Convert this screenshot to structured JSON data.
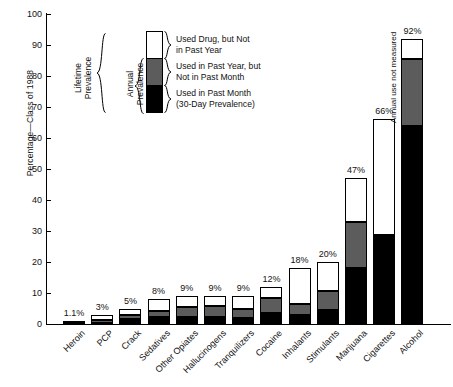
{
  "chart_data": {
    "type": "bar",
    "title": "",
    "subtitle": "",
    "xlabel": "",
    "ylabel": "Percentage—Class of 1988",
    "ylim": [
      0,
      100
    ],
    "ytick_values": [
      0,
      10,
      20,
      30,
      40,
      50,
      60,
      70,
      80,
      90,
      100
    ],
    "ytick_labels": [
      "0",
      "10",
      "20",
      "30",
      "40",
      "50",
      "60",
      "70",
      "80",
      "90",
      "100"
    ],
    "grid": false,
    "legend_position": "inside-upper-left",
    "stacked": true,
    "categories": [
      "Heroin",
      "PCP",
      "Crack",
      "Sedatives",
      "Other Opiates",
      "Hallucinogens",
      "Tranquilizers",
      "Cocaine",
      "Inhalants",
      "Stimulants",
      "Marijuana",
      "Cigarettes",
      "Alcohol"
    ],
    "series": [
      {
        "name": "Used in Past Month (30-Day Prevalence)",
        "color": "#000000",
        "values": [
          0.2,
          0.3,
          1.6,
          2.3,
          2.4,
          2.2,
          2.0,
          3.4,
          2.9,
          4.6,
          18.0,
          28.7,
          63.9
        ]
      },
      {
        "name": "Used in Past Year, but Not in Past Month",
        "color": "#5c5c5c",
        "values": [
          0.3,
          1.1,
          1.4,
          2.0,
          3.1,
          3.6,
          2.8,
          4.9,
          3.6,
          5.9,
          15.0,
          null,
          21.6
        ]
      },
      {
        "name": "Used Drug, but Not in Past Year",
        "color": "#ffffff",
        "values": [
          0.6,
          1.6,
          2.0,
          3.7,
          3.5,
          3.2,
          4.2,
          3.7,
          11.5,
          9.5,
          14.0,
          37.3,
          6.5
        ]
      }
    ],
    "totals": [
      1.1,
      3,
      5,
      8,
      9,
      9,
      9,
      12,
      18,
      20,
      47,
      66,
      92
    ],
    "value_labels": [
      "1.1%",
      "3%",
      "5%",
      "8%",
      "9%",
      "9%",
      "9%",
      "12%",
      "18%",
      "20%",
      "47%",
      "66%",
      "92%"
    ],
    "annotations": [
      {
        "text": "Annual use not measured",
        "category": "Cigarettes",
        "orientation": "vertical"
      }
    ]
  },
  "legend": {
    "items": [
      {
        "label_line1": "Used Drug, but Not",
        "label_line2": "in Past Year",
        "swatch": "white"
      },
      {
        "label_line1": "Used in Past Year, but",
        "label_line2": "Not in Past Month",
        "swatch": "gray"
      },
      {
        "label_line1": "Used in Past Month",
        "label_line2": "(30-Day Prevalence)",
        "swatch": "black"
      }
    ],
    "brackets": [
      {
        "label": "Lifetime\nPrevalence"
      },
      {
        "label": "Annual\nPrevalence"
      }
    ]
  },
  "colors": {
    "past_month": "#000000",
    "past_year_not_month": "#5c5c5c",
    "not_past_year": "#ffffff",
    "axis": "#000000",
    "text": "#111111"
  }
}
